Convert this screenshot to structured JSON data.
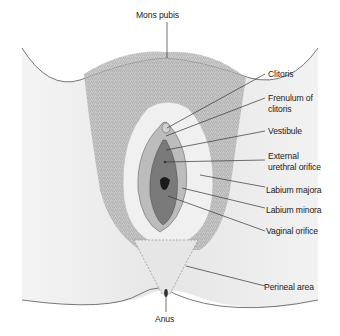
{
  "diagram": {
    "type": "anatomical-illustration",
    "labels": {
      "mons_pubis": "Mons pubis",
      "clitoris": "Clitoris",
      "frenulum_line1": "Frenulum of",
      "frenulum_line2": "clitoris",
      "vestibule": "Vestibule",
      "urethral_line1": "External",
      "urethral_line2": "urethral orifice",
      "labium_majora": "Labium majora",
      "labium_minora": "Labium minora",
      "vaginal_orifice": "Vaginal orifice",
      "perineal_area": "Perineal area",
      "anus": "Anus"
    },
    "colors": {
      "background": "#ffffff",
      "skin": "#ececec",
      "skin_shadow": "#d6d6d6",
      "outline": "#555555",
      "hair": "#8a8a8a",
      "inner": "#9a9a9a",
      "vestibule": "#6e6e6e",
      "leader_line": "#333333"
    }
  }
}
